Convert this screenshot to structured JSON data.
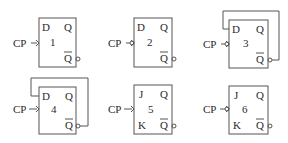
{
  "diagram": {
    "title": "",
    "flip_flops": [
      {
        "id": "1",
        "type": "D",
        "inputs": [
          "D"
        ],
        "outputs": [
          "Q",
          "Q̄"
        ],
        "clock_label": "CP",
        "clock_trigger": "rising-edge",
        "feedback": "none"
      },
      {
        "id": "2",
        "type": "D",
        "inputs": [
          "D"
        ],
        "outputs": [
          "Q",
          "Q̄"
        ],
        "clock_label": "CP",
        "clock_trigger": "falling-edge",
        "feedback": "none"
      },
      {
        "id": "3",
        "type": "D",
        "inputs": [
          "D"
        ],
        "outputs": [
          "Q",
          "Q̄"
        ],
        "clock_label": "CP",
        "clock_trigger": "falling-edge",
        "feedback": "Q̄ to D"
      },
      {
        "id": "4",
        "type": "D",
        "inputs": [
          "D"
        ],
        "outputs": [
          "Q",
          "Q̄"
        ],
        "clock_label": "CP",
        "clock_trigger": "rising-edge",
        "feedback": "Q̄ to D"
      },
      {
        "id": "5",
        "type": "JK",
        "inputs": [
          "J",
          "K"
        ],
        "outputs": [
          "Q",
          "Q̄"
        ],
        "clock_label": "CP",
        "clock_trigger": "rising-edge",
        "feedback": "none"
      },
      {
        "id": "6",
        "type": "JK",
        "inputs": [
          "J",
          "K"
        ],
        "outputs": [
          "Q",
          "Q̄"
        ],
        "clock_label": "CP",
        "clock_trigger": "falling-edge",
        "feedback": "none"
      }
    ],
    "labels": {
      "cp": "CP",
      "d": "D",
      "j": "J",
      "k": "K",
      "q": "Q",
      "qbar": "Q",
      "n1": "1",
      "n2": "2",
      "n3": "3",
      "n4": "4",
      "n5": "5",
      "n6": "6"
    }
  }
}
